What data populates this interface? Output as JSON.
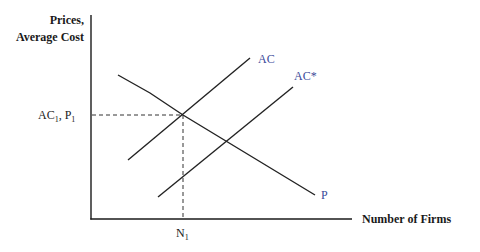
{
  "diagram": {
    "y_axis_label_line1": "Prices,",
    "y_axis_label_line2": "Average Cost",
    "x_axis_label": "Number of Firms",
    "equilibrium_y_label_main": "AC",
    "equilibrium_y_label_sub": "1",
    "equilibrium_y_label_sep": ", P",
    "equilibrium_y_label_sub2": "1",
    "equilibrium_x_label_main": "N",
    "equilibrium_x_label_sub": "1",
    "curves": [
      {
        "id": "AC",
        "label": "AC",
        "slope": "upward"
      },
      {
        "id": "AC_star",
        "label": "AC*",
        "slope": "upward"
      },
      {
        "id": "P",
        "label": "P",
        "slope": "downward"
      }
    ],
    "colors": {
      "curve_label": "#3a4a9a",
      "axis": "#1a1a1a"
    }
  }
}
